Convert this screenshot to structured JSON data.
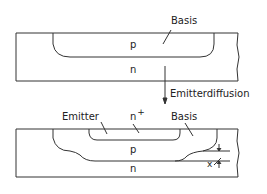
{
  "top": {
    "label_basis": "Basis",
    "label_p": "p",
    "label_n": "n"
  },
  "process": {
    "label": "Emitterdiffusion"
  },
  "bottom": {
    "label_emitter": "Emitter",
    "label_nplus": "n",
    "label_nplus_sup": "+",
    "label_basis": "Basis",
    "label_p": "p",
    "label_n": "n",
    "label_x": "x"
  }
}
